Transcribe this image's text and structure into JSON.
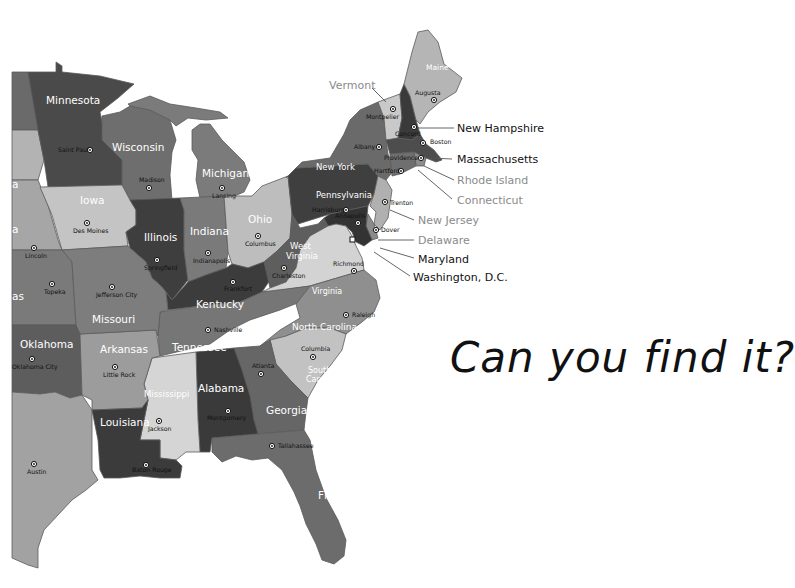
{
  "title": "Can you find it?",
  "colors": {
    "background": "#ffffff",
    "water": "#ffffff",
    "capital_text": "#111111",
    "callout_dark": "#111111",
    "callout_gray": "#8a8a8a"
  },
  "states": [
    {
      "name": "Minnesota",
      "label": "Minnesota",
      "fill": "#4a4a4a",
      "capital": "Saint Paul"
    },
    {
      "name": "Wisconsin",
      "label": "Wisconsin",
      "fill": "#6e6e6e",
      "capital": "Madison"
    },
    {
      "name": "Michigan",
      "label": "Michigan",
      "fill": "#7b7b7b",
      "capital": "Lansing"
    },
    {
      "name": "Iowa",
      "label": "Iowa",
      "fill": "#c4c4c4",
      "capital": "Des Moines"
    },
    {
      "name": "Illinois",
      "label": "Illinois",
      "fill": "#3e3e3e",
      "capital": "Springfield"
    },
    {
      "name": "Indiana",
      "label": "Indiana",
      "fill": "#7a7a7a",
      "capital": "Indianapolis"
    },
    {
      "name": "Ohio",
      "label": "Ohio",
      "fill": "#bdbdbd",
      "capital": "Columbus"
    },
    {
      "name": "Pennsylvania",
      "label": "Pennsylvania",
      "fill": "#3f3f3f",
      "capital": "Harrisburg"
    },
    {
      "name": "New York",
      "label": "New York",
      "fill": "#6a6a6a",
      "capital": "Albany"
    },
    {
      "name": "Vermont",
      "label": "Vermont",
      "fill": "#c9c9c9",
      "capital": "Montpelier"
    },
    {
      "name": "New Hampshire",
      "label": "New Hampshire",
      "fill": "#3a3a3a",
      "capital": "Concord"
    },
    {
      "name": "Maine",
      "label": "Maine",
      "fill": "#b5b5b5",
      "capital": "Augusta"
    },
    {
      "name": "Massachusetts",
      "label": "Massachusetts",
      "fill": "#4d4d4d",
      "capital": "Boston"
    },
    {
      "name": "Rhode Island",
      "label": "Rhode Island",
      "fill": "#8c8c8c",
      "capital": "Providence"
    },
    {
      "name": "Connecticut",
      "label": "Connecticut",
      "fill": "#6f6f6f",
      "capital": "Hartford"
    },
    {
      "name": "New Jersey",
      "label": "New Jersey",
      "fill": "#b0b0b0",
      "capital": "Trenton"
    },
    {
      "name": "Delaware",
      "label": "Delaware",
      "fill": "#8a8a8a",
      "capital": "Dover"
    },
    {
      "name": "Maryland",
      "label": "Maryland",
      "fill": "#333333",
      "capital": "Annapolis"
    },
    {
      "name": "Washington, D.C.",
      "label": "Washington, D.C.",
      "fill": "#d0d0d0",
      "capital": ""
    },
    {
      "name": "West Virginia",
      "label": "West Virginia",
      "fill": "#5e5e5e",
      "capital": "Charleston"
    },
    {
      "name": "Virginia",
      "label": "Virginia",
      "fill": "#d3d3d3",
      "capital": "Richmond"
    },
    {
      "name": "Kentucky",
      "label": "Kentucky",
      "fill": "#3c3c3c",
      "capital": "Frankfort"
    },
    {
      "name": "Tennessee",
      "label": "Tennessee",
      "fill": "#767676",
      "capital": "Nashville"
    },
    {
      "name": "North Carolina",
      "label": "North Carolina",
      "fill": "#8f8f8f",
      "capital": "Raleigh"
    },
    {
      "name": "South Carolina",
      "label": "South Carolina",
      "fill": "#c2c2c2",
      "capital": "Columbia"
    },
    {
      "name": "Georgia",
      "label": "Georgia",
      "fill": "#666666",
      "capital": "Atlanta"
    },
    {
      "name": "Alabama",
      "label": "Alabama",
      "fill": "#3a3a3a",
      "capital": "Montgomery"
    },
    {
      "name": "Mississippi",
      "label": "Mississippi",
      "fill": "#d5d5d5",
      "capital": "Jackson"
    },
    {
      "name": "Florida",
      "label": "Florida",
      "fill": "#6c6c6c",
      "capital": "Tallahassee"
    },
    {
      "name": "Louisiana",
      "label": "Louisiana",
      "fill": "#3b3b3b",
      "capital": "Baton Rouge"
    },
    {
      "name": "Arkansas",
      "label": "Arkansas",
      "fill": "#9c9c9c",
      "capital": "Little Rock"
    },
    {
      "name": "Missouri",
      "label": "Missouri",
      "fill": "#7d7d7d",
      "capital": "Jefferson City"
    },
    {
      "name": "Oklahoma",
      "label": "Oklahoma",
      "fill": "#5d5d5d",
      "capital": "Oklahoma City"
    },
    {
      "name": "Kansas",
      "label": "as",
      "fill": "#7a7a7a",
      "capital": "Topeka"
    },
    {
      "name": "Nebraska",
      "label": "a",
      "fill": "#a6a6a6",
      "capital": "Lincoln"
    },
    {
      "name": "South Dakota",
      "label": "a",
      "fill": "#b3b3b3",
      "capital": ""
    },
    {
      "name": "North Dakota",
      "label": "",
      "fill": "#6a6a6a",
      "capital": ""
    },
    {
      "name": "Texas",
      "label": "",
      "fill": "#a2a2a2",
      "capital": "Austin"
    }
  ],
  "callouts": [
    {
      "label": "Vermont",
      "color": "#8a8a8a"
    },
    {
      "label": "New Hampshire",
      "color": "#111111"
    },
    {
      "label": "Massachusetts",
      "color": "#111111"
    },
    {
      "label": "Rhode Island",
      "color": "#8a8a8a"
    },
    {
      "label": "Connecticut",
      "color": "#8a8a8a"
    },
    {
      "label": "New Jersey",
      "color": "#8a8a8a"
    },
    {
      "label": "Delaware",
      "color": "#8a8a8a"
    },
    {
      "label": "Maryland",
      "color": "#111111"
    },
    {
      "label": "Washington, D.C.",
      "color": "#111111"
    }
  ]
}
